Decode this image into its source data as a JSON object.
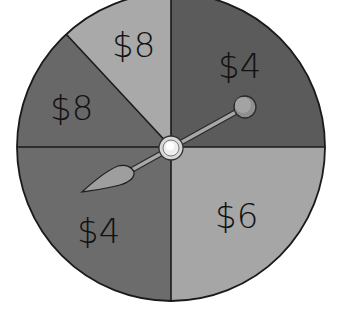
{
  "spinner": {
    "center": {
      "x": 171,
      "y": 147
    },
    "radius": 154,
    "sections": [
      {
        "label": "$4",
        "color": "#5b5b5b",
        "position": "top-right"
      },
      {
        "label": "$6",
        "color": "#a6a6a6",
        "position": "bottom-right"
      },
      {
        "label": "$4",
        "color": "#6c6c6c",
        "position": "bottom-left"
      },
      {
        "label": "$8",
        "color": "#686868",
        "position": "left"
      },
      {
        "label": "$8",
        "color": "#a9a9a9",
        "position": "top-left"
      }
    ],
    "pointer": {
      "points_to": "$4",
      "color": "#9a9a9a"
    }
  }
}
